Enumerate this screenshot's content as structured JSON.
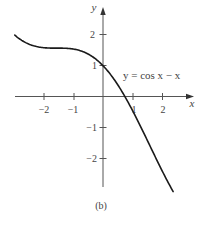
{
  "chart_data": {
    "type": "line",
    "title": "",
    "caption": "(b)",
    "xlabel": "x",
    "ylabel": "y",
    "xlim": [
      -3,
      2.4
    ],
    "ylim": [
      -3.1,
      2.9
    ],
    "grid": false,
    "x_ticks": [
      -2,
      -1,
      1,
      2
    ],
    "x_tick_labels": [
      "−2",
      "−1",
      "1",
      "2"
    ],
    "y_ticks": [
      2,
      1,
      -1,
      -2
    ],
    "y_tick_labels": [
      "2",
      "1",
      "−1",
      "−2"
    ],
    "series": [
      {
        "name": "y = cos x − x",
        "function": "cos(x) - x",
        "x": [
          -2.98,
          -2.5,
          -2.0,
          -1.5,
          -1.0,
          -0.5,
          0.0,
          0.5,
          0.74,
          1.0,
          1.5,
          2.0,
          2.37
        ],
        "values": [
          1.99,
          1.7,
          1.58,
          1.57,
          1.54,
          1.38,
          1.0,
          0.38,
          0.0,
          -0.46,
          -1.43,
          -2.42,
          -3.09
        ]
      }
    ],
    "annotations": [
      {
        "text": "y = cos x − x",
        "x": 0.65,
        "y": 0.55
      }
    ]
  },
  "labels": {
    "x_axis": "x",
    "y_axis": "y",
    "equation": "y = cos x − x",
    "caption": "(b)",
    "xt": [
      "−2",
      "−1",
      "1",
      "2"
    ],
    "yt": [
      "2",
      "1",
      "−1",
      "−2"
    ]
  }
}
